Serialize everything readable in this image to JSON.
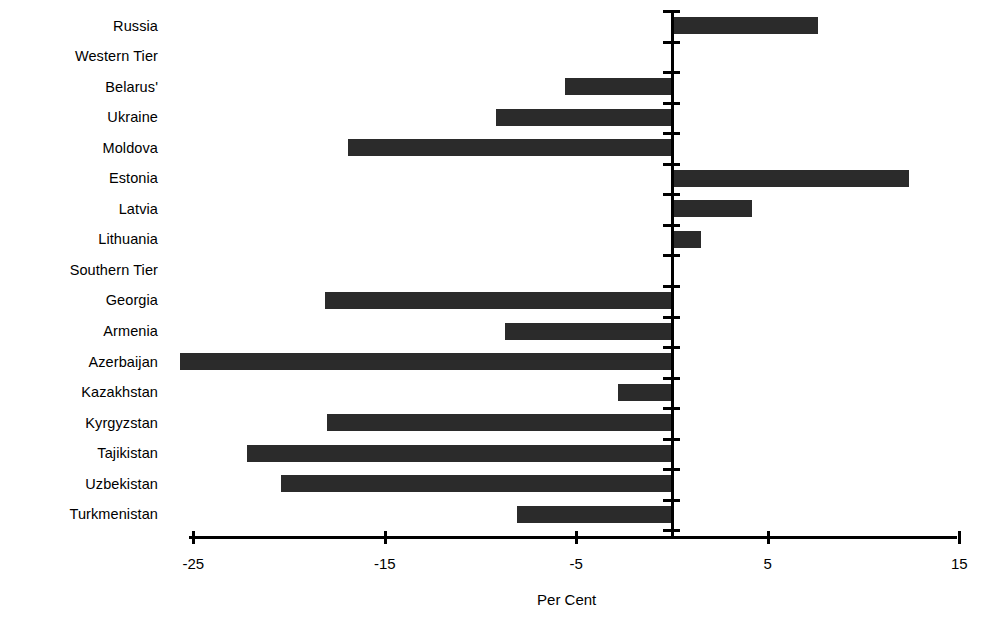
{
  "chart_data": {
    "type": "bar",
    "orientation": "horizontal",
    "title": "",
    "xlabel": "Per Cent",
    "ylabel": "",
    "xlim": [
      -27,
      15
    ],
    "xticks": [
      -25,
      -15,
      -5,
      5,
      15
    ],
    "xtick_labels": [
      "-25",
      "-15",
      "-5",
      "5",
      "15"
    ],
    "grid": false,
    "legend": false,
    "bar_color": "#2b2b2b",
    "axis_color": "#000000",
    "categories": [
      "Russia",
      "Western Tier",
      "Belarus'",
      "Ukraine",
      "Moldova",
      "Estonia",
      "Latvia",
      "Lithuania",
      "Southern Tier",
      "Georgia",
      "Armenia",
      "Azerbaijan",
      "Kazakhstan",
      "Kyrgyzstan",
      "Tajikistan",
      "Uzbekistan",
      "Turkmenistan"
    ],
    "values": [
      7.6,
      null,
      -5.6,
      -9.2,
      -16.9,
      12.4,
      4.2,
      1.5,
      null,
      -18.1,
      -8.7,
      -25.7,
      -2.8,
      -18.0,
      -22.2,
      -20.4,
      -8.1
    ],
    "group_headers": [
      "Western Tier",
      "Southern Tier"
    ]
  }
}
